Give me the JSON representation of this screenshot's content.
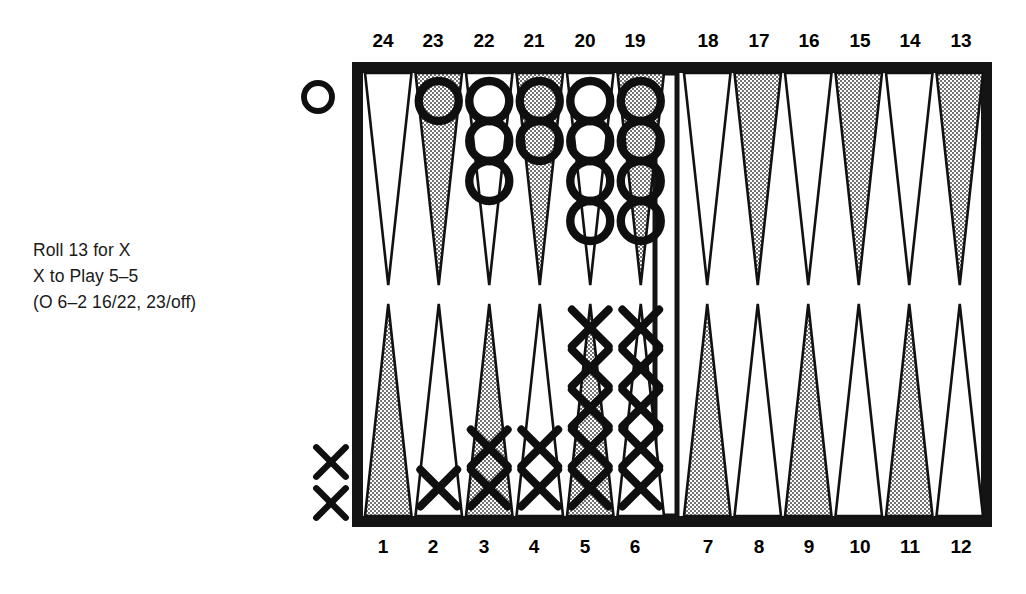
{
  "caption": {
    "lines": [
      "Roll 13 for X",
      "X to Play 5–5",
      "(O 6–2 16/22, 23/off)"
    ]
  },
  "board": {
    "frame_color": "#141414",
    "point_shaded_color": "#b7b7b7",
    "point_white_color": "#ffffff",
    "background": "#ffffff",
    "top_labels": [
      "24",
      "23",
      "22",
      "21",
      "20",
      "19",
      "18",
      "17",
      "16",
      "15",
      "14",
      "13"
    ],
    "bottom_labels": [
      "1",
      "2",
      "3",
      "4",
      "5",
      "6",
      "7",
      "8",
      "9",
      "10",
      "11",
      "12"
    ],
    "o_side_label": "O",
    "x_side_label": "X",
    "off_o_count": 1,
    "off_x_count": 2,
    "points": [
      {
        "number": "24",
        "half": "top",
        "side": "left",
        "index": 0,
        "shaded": false,
        "owner": null,
        "count": 0
      },
      {
        "number": "23",
        "half": "top",
        "side": "left",
        "index": 1,
        "shaded": true,
        "owner": "O",
        "count": 1
      },
      {
        "number": "22",
        "half": "top",
        "side": "left",
        "index": 2,
        "shaded": false,
        "owner": "O",
        "count": 3
      },
      {
        "number": "21",
        "half": "top",
        "side": "left",
        "index": 3,
        "shaded": true,
        "owner": "O",
        "count": 2
      },
      {
        "number": "20",
        "half": "top",
        "side": "left",
        "index": 4,
        "shaded": false,
        "owner": "O",
        "count": 4
      },
      {
        "number": "19",
        "half": "top",
        "side": "left",
        "index": 5,
        "shaded": true,
        "owner": "O",
        "count": 4
      },
      {
        "number": "18",
        "half": "top",
        "side": "right",
        "index": 0,
        "shaded": false,
        "owner": null,
        "count": 0
      },
      {
        "number": "17",
        "half": "top",
        "side": "right",
        "index": 1,
        "shaded": true,
        "owner": null,
        "count": 0
      },
      {
        "number": "16",
        "half": "top",
        "side": "right",
        "index": 2,
        "shaded": false,
        "owner": null,
        "count": 0
      },
      {
        "number": "15",
        "half": "top",
        "side": "right",
        "index": 3,
        "shaded": true,
        "owner": null,
        "count": 0
      },
      {
        "number": "14",
        "half": "top",
        "side": "right",
        "index": 4,
        "shaded": false,
        "owner": null,
        "count": 0
      },
      {
        "number": "13",
        "half": "top",
        "side": "right",
        "index": 5,
        "shaded": true,
        "owner": null,
        "count": 0
      },
      {
        "number": "1",
        "half": "bottom",
        "side": "left",
        "index": 0,
        "shaded": true,
        "owner": null,
        "count": 0
      },
      {
        "number": "2",
        "half": "bottom",
        "side": "left",
        "index": 1,
        "shaded": false,
        "owner": "X",
        "count": 1
      },
      {
        "number": "3",
        "half": "bottom",
        "side": "left",
        "index": 2,
        "shaded": true,
        "owner": "X",
        "count": 2
      },
      {
        "number": "4",
        "half": "bottom",
        "side": "left",
        "index": 3,
        "shaded": false,
        "owner": "X",
        "count": 2
      },
      {
        "number": "5",
        "half": "bottom",
        "side": "left",
        "index": 4,
        "shaded": true,
        "owner": "X",
        "count": 5
      },
      {
        "number": "6",
        "half": "bottom",
        "side": "left",
        "index": 5,
        "shaded": false,
        "owner": "X",
        "count": 5
      },
      {
        "number": "7",
        "half": "bottom",
        "side": "right",
        "index": 0,
        "shaded": true,
        "owner": null,
        "count": 0
      },
      {
        "number": "8",
        "half": "bottom",
        "side": "right",
        "index": 1,
        "shaded": false,
        "owner": null,
        "count": 0
      },
      {
        "number": "9",
        "half": "bottom",
        "side": "right",
        "index": 2,
        "shaded": true,
        "owner": null,
        "count": 0
      },
      {
        "number": "10",
        "half": "bottom",
        "side": "right",
        "index": 3,
        "shaded": false,
        "owner": null,
        "count": 0
      },
      {
        "number": "11",
        "half": "bottom",
        "side": "right",
        "index": 4,
        "shaded": true,
        "owner": null,
        "count": 0
      },
      {
        "number": "12",
        "half": "bottom",
        "side": "right",
        "index": 5,
        "shaded": false,
        "owner": null,
        "count": 0
      }
    ]
  },
  "geometry": {
    "frame_x": 352,
    "frame_y": 62,
    "frame_w": 640,
    "frame_h": 465,
    "frame_thickness": 11,
    "bar_x": 655,
    "bar_w": 22,
    "point_width": 50.5,
    "point_height": 212,
    "checker_r": 20,
    "checker_step": 40
  }
}
